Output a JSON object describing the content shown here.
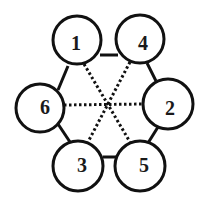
{
  "diagram": {
    "nodes": [
      {
        "id": "1",
        "label": "1",
        "cx": 77,
        "cy": 40
      },
      {
        "id": "4",
        "label": "4",
        "cx": 140,
        "cy": 39
      },
      {
        "id": "6",
        "label": "6",
        "cx": 40,
        "cy": 108
      },
      {
        "id": "2",
        "label": "2",
        "cx": 168,
        "cy": 104
      },
      {
        "id": "3",
        "label": "3",
        "cx": 78,
        "cy": 166
      },
      {
        "id": "5",
        "label": "5",
        "cx": 140,
        "cy": 166
      }
    ],
    "solid_edges": [
      [
        "1",
        "4"
      ],
      [
        "4",
        "2"
      ],
      [
        "2",
        "5"
      ],
      [
        "5",
        "3"
      ],
      [
        "3",
        "6"
      ],
      [
        "6",
        "1"
      ]
    ],
    "dotted_edges": [
      [
        "1",
        "5"
      ],
      [
        "4",
        "3"
      ],
      [
        "6",
        "2"
      ]
    ],
    "colors": {
      "stroke": "#111111",
      "background": "#ffffff"
    }
  }
}
